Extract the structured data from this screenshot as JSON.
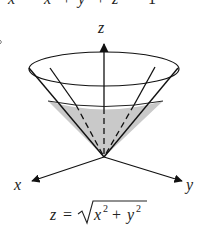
{
  "top_equation": {
    "left_label": "x",
    "text": "x² + y² + z² = 1",
    "parts": {
      "x": "x",
      "y": "y",
      "z": "z",
      "exp": "2",
      "plus": "+",
      "eq": "=",
      "rhs": "1"
    }
  },
  "axes": {
    "z_label": "z",
    "x_label": "x",
    "y_label": "y"
  },
  "cone": {
    "shaded_color": "#c8c8c8",
    "line_color": "#1a1a1a"
  },
  "bottom_equation": {
    "text": "z = √(x² + y²)",
    "lhs": "z",
    "eq": "=",
    "x": "x",
    "y": "y",
    "exp": "2",
    "plus": "+"
  }
}
